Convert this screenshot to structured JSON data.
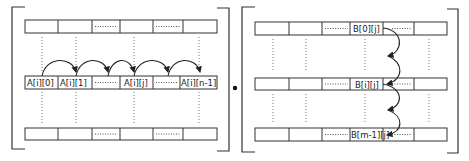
{
  "diagram": {
    "operator": "•",
    "matrix_a": {
      "name": "A",
      "traversal": "row-wise",
      "highlight_row_labels": [
        "A[i][0]",
        "A[i][1]",
        "",
        "A[i][j]",
        "",
        "A[i][n-1]"
      ]
    },
    "matrix_b": {
      "name": "B",
      "traversal": "column-wise",
      "column_labels": [
        "B[0][j]",
        "B[i][j]",
        "B[m-1][j]"
      ]
    }
  }
}
